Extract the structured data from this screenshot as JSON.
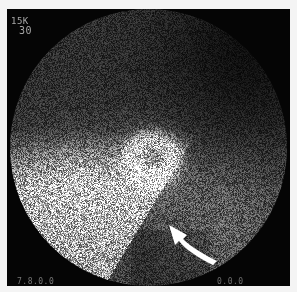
{
  "image": {
    "kind": "gamma-camera scintigram",
    "labels": {
      "top_left_line1": "15K",
      "top_left_line2": "30",
      "bottom_left": "7.8.0.0",
      "bottom_right": "0.0.0"
    },
    "annotation": {
      "type": "curved-arrow",
      "color": "#ffffff",
      "points_to": "central ring-shaped uptake"
    },
    "colors": {
      "background": "#f4f4f4",
      "frame": "#050505",
      "field": "#1c1c1c",
      "bright_uptake": "#bdbdbd"
    }
  }
}
